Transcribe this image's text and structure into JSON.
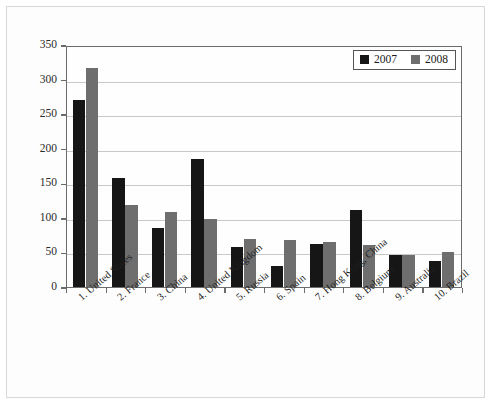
{
  "chart_data": {
    "type": "bar",
    "title": "",
    "subtitle": "",
    "xlabel": "",
    "ylabel": "",
    "ylim": [
      0,
      350
    ],
    "ytick_step": 50,
    "yticks": [
      "0",
      "50",
      "100",
      "150",
      "200",
      "250",
      "300",
      "350"
    ],
    "grid": true,
    "legend_position": "top-right",
    "categories": [
      "1. United States",
      "2. France",
      "3. China",
      "4. United Kingdom",
      "5. Russia",
      "6. Spain",
      "7. Hong Kong, China",
      "8. Belgium",
      "9. Australia",
      "10. Brazil"
    ],
    "series": [
      {
        "name": "2007",
        "color": "#161616",
        "values": [
          270,
          158,
          86,
          185,
          58,
          31,
          62,
          112,
          46,
          38
        ]
      },
      {
        "name": "2008",
        "color": "#6e6e6e",
        "values": [
          317,
          118,
          109,
          98,
          70,
          68,
          65,
          61,
          47,
          50
        ]
      }
    ]
  },
  "legend": {
    "entries": [
      {
        "label": "2007"
      },
      {
        "label": "2008"
      }
    ]
  },
  "colors": {
    "series_2007": "#161616",
    "series_2008": "#6e6e6e",
    "axis": "#6b6b6b",
    "grid": "#c9c9c9",
    "background": "#ffffff"
  }
}
